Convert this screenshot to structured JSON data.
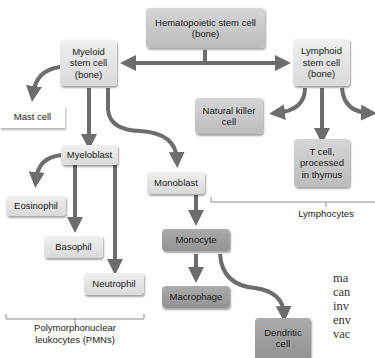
{
  "nodes": {
    "hsc": {
      "line1": "Hematopoietic stem cell",
      "line2": "(bone)"
    },
    "myeloid": {
      "line1": "Myeloid",
      "line2": "stem cell",
      "line3": "(bone)"
    },
    "lymphoid": {
      "line1": "Lymphoid",
      "line2": "stem cell",
      "line3": "(bone)"
    },
    "mast": {
      "label": "Mast cell"
    },
    "nk": {
      "line1": "Natural killer",
      "line2": "cell"
    },
    "tcell": {
      "line1": "T cell,",
      "line2": "processed",
      "line3": "in thymus"
    },
    "myeloblast": {
      "label": "Myeloblast"
    },
    "monoblast": {
      "label": "Monoblast"
    },
    "eosinophil": {
      "label": "Eosinophil"
    },
    "basophil": {
      "label": "Basophil"
    },
    "neutrophil": {
      "label": "Neutrophil"
    },
    "monocyte": {
      "label": "Monocyte"
    },
    "macrophage": {
      "label": "Macrophage"
    },
    "dendritic": {
      "line1": "Dendritic",
      "line2": "cell"
    }
  },
  "groups": {
    "lymphocytes": "Lymphocytes",
    "pmns_line1": "Polymorphonuclear",
    "pmns_line2": "leukocytes (PMNs)"
  },
  "body_text": [
    "ma",
    "can",
    "inv",
    "env",
    "vac"
  ],
  "colors": {
    "arrow": "#6d6d6d",
    "bracket": "#8a8a8a"
  }
}
